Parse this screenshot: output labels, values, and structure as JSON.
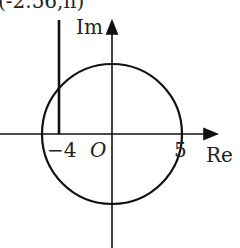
{
  "diagram": {
    "top_label": "(-2.56,π)",
    "axes": {
      "x_label": "Re",
      "y_label": "Im",
      "origin_label": "O"
    },
    "ticks": {
      "left": "−4",
      "right": "5"
    },
    "circle": {
      "center": [
        0,
        0
      ],
      "radius": 5
    },
    "vertical_segment": {
      "x": -4
    },
    "colors": {
      "stroke": "#111111",
      "background": "#ffffff"
    }
  }
}
